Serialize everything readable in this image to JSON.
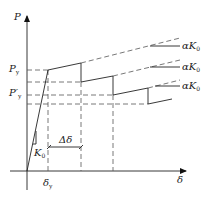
{
  "diagram": {
    "type": "force-displacement degradation curve",
    "axes": {
      "y_label": "P",
      "x_label": "δ"
    },
    "levels": [
      {
        "name": "P_y",
        "label": "P",
        "sub": "y",
        "prime": ""
      },
      {
        "name": "P'_y",
        "label": "P",
        "sub": "y",
        "prime": "′"
      }
    ],
    "annotations": {
      "initial_stiffness": {
        "label": "K",
        "sub": "0"
      },
      "displacement_step": "Δδ",
      "yield_displacement": {
        "label": "δ",
        "sub": "y"
      },
      "post_yield_stiffness": [
        {
          "label": "αK",
          "sub": "0"
        },
        {
          "label": "αK",
          "sub": "0"
        },
        {
          "label": "αK",
          "sub": "0"
        }
      ]
    },
    "colors": {
      "line": "#222222",
      "dash": "#555555"
    }
  }
}
